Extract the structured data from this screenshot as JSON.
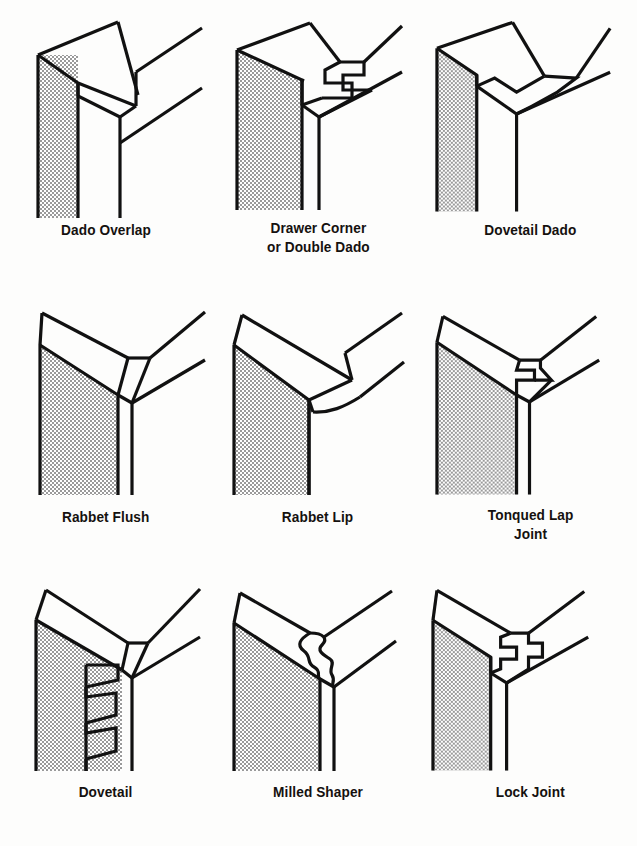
{
  "document": {
    "title": "Woodworking Corner Joint Types",
    "description": "Nine isometric line drawings of cabinet and drawer corner joints, each with a bold caption beneath.",
    "columns": 3,
    "rows": 3,
    "background_color": "#fdfdfc",
    "line_color": "#111111",
    "hatch_color": "#8a8a8a"
  },
  "figures": [
    {
      "index": 1,
      "label": "Dado Overlap",
      "label_lines": "Dado Overlap",
      "row": 1,
      "column": 1,
      "joint_family": "dado",
      "description": "Side panel with a single dado groove; the overlapping top board extends past the joint."
    },
    {
      "index": 2,
      "label": "Drawer Corner or Double Dado",
      "label_lines": "Drawer Corner\nor Double Dado",
      "row": 1,
      "column": 2,
      "joint_family": "dado",
      "description": "Interlocking double dado with two square tongues locking front and side together."
    },
    {
      "index": 3,
      "label": "Dovetail Dado",
      "label_lines": "Dovetail Dado",
      "row": 1,
      "column": 3,
      "joint_family": "dovetail",
      "description": "A single angled dovetail tongue seated into a matching tapered socket."
    },
    {
      "index": 4,
      "label": "Rabbet Flush",
      "label_lines": "Rabbet Flush",
      "row": 2,
      "column": 1,
      "joint_family": "rabbet",
      "description": "Simple rabbeted corner where the face of the joining board sits flush with the side."
    },
    {
      "index": 5,
      "label": "Rabbet Lip",
      "label_lines": "Rabbet Lip",
      "row": 2,
      "column": 2,
      "joint_family": "rabbet",
      "description": "Rabbeted corner with a rounded overhanging lip projecting past the side panel."
    },
    {
      "index": 6,
      "label": "Tonqued Lap Joint",
      "label_lines": "Tonqued Lap\nJoint",
      "row": 2,
      "column": 3,
      "joint_family": "lap",
      "description": "Lap joint with a square tongue and matching groove stepping across the corner."
    },
    {
      "index": 7,
      "label": "Dovetail",
      "label_lines": "Dovetail",
      "row": 3,
      "column": 1,
      "joint_family": "dovetail",
      "description": "Through dovetail showing a vertical stack of three tapered pins and tails."
    },
    {
      "index": 8,
      "label": "Milled Shaper",
      "label_lines": "Milled Shaper",
      "row": 3,
      "column": 2,
      "joint_family": "milled",
      "description": "Milled shaper joint with an undulating interlocking wave profile."
    },
    {
      "index": 9,
      "label": "Lock Joint",
      "label_lines": "Lock Joint",
      "row": 3,
      "column": 3,
      "joint_family": "lock",
      "description": "Lock joint with a stepped square key engaging a matching recess."
    }
  ]
}
